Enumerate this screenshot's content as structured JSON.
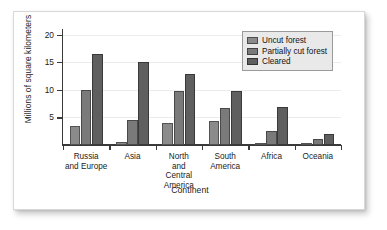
{
  "chart_data": {
    "type": "bar",
    "title": "",
    "xlabel": "Continent",
    "ylabel": "Millions of square kilometers",
    "categories": [
      "Russia\nand Europe",
      "Asia",
      "North\nand\nCentral\nAmerica",
      "South\nAmerica",
      "Africa",
      "Oceania"
    ],
    "series": [
      {
        "name": "Uncut forest",
        "color": "#8b8b8b",
        "values": [
          3.5,
          0.5,
          4.0,
          4.3,
          0.3,
          0.2
        ]
      },
      {
        "name": "Partially cut forest",
        "color": "#7a7a7a",
        "values": [
          9.9,
          4.5,
          9.7,
          6.7,
          2.5,
          1.0
        ]
      },
      {
        "name": "Cleared",
        "color": "#5f5f5f",
        "values": [
          16.5,
          15.1,
          12.8,
          9.8,
          6.8,
          2.0
        ]
      }
    ],
    "ylim": [
      0,
      21
    ],
    "yticks": [
      5,
      10,
      15,
      20
    ],
    "ytick_labels": [
      "5",
      "10",
      "15",
      "20"
    ],
    "grid": true,
    "legend_position": "top-right"
  }
}
